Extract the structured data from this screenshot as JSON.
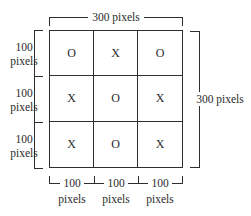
{
  "diagram": {
    "top_label": "300 pixels",
    "right_label": "300 pixels",
    "left_labels": [
      {
        "value": "100",
        "unit": "pixels"
      },
      {
        "value": "100",
        "unit": "pixels"
      },
      {
        "value": "100",
        "unit": "pixels"
      }
    ],
    "bottom_labels": [
      {
        "value": "100",
        "unit": "pixels"
      },
      {
        "value": "100",
        "unit": "pixels"
      },
      {
        "value": "100",
        "unit": "pixels"
      }
    ],
    "grid": [
      [
        "O",
        "X",
        "O"
      ],
      [
        "X",
        "O",
        "X"
      ],
      [
        "X",
        "O",
        "X"
      ]
    ]
  }
}
